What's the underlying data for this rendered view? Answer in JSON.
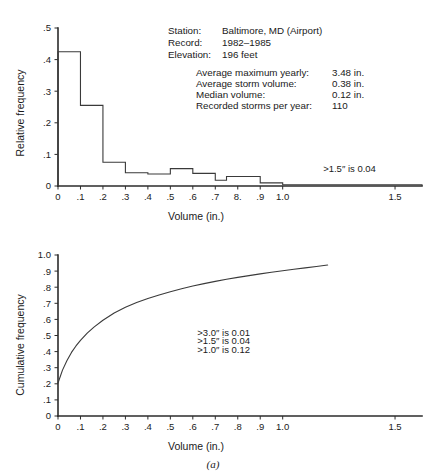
{
  "figure": {
    "caption": "(a)"
  },
  "station_info": {
    "station_label": "Station:",
    "station_value": "Baltimore, MD (Airport)",
    "record_label": "Record:",
    "record_value": "1982–1985",
    "elevation_label": "Elevation:",
    "elevation_value": "196 feet"
  },
  "stats": [
    {
      "label": "Average maximum yearly:",
      "value": "3.48 in."
    },
    {
      "label": "Average storm volume:",
      "value": "0.38 in."
    },
    {
      "label": "Median volume:",
      "value": "0.12 in."
    },
    {
      "label": "Recorded storms per year:",
      "value": "110"
    }
  ],
  "chart_data": [
    {
      "type": "bar",
      "id": "relative-frequency-histogram",
      "title": "",
      "xlabel": "Volume (in.)",
      "ylabel": "Relative frequency",
      "xlim": [
        0,
        1.62
      ],
      "ylim": [
        0,
        0.5
      ],
      "grid": false,
      "legend": null,
      "xticks": [
        0,
        0.1,
        0.2,
        0.3,
        0.4,
        0.5,
        0.6,
        0.7,
        0.8,
        0.9,
        1.0,
        1.5
      ],
      "xticklabels": [
        "0",
        ".1",
        ".2",
        ".3",
        ".4",
        ".5",
        ".6",
        ".7",
        "8.",
        ".9",
        "1.0",
        "1.5"
      ],
      "yticks": [
        0,
        0.1,
        0.2,
        0.3,
        0.4,
        0.5
      ],
      "yticklabels": [
        "0",
        ".1",
        ".2",
        ".3",
        ".4",
        ".5"
      ],
      "bin_edges": [
        0.0,
        0.05,
        0.1,
        0.15,
        0.2,
        0.25,
        0.3,
        0.35,
        0.4,
        0.45,
        0.5,
        0.55,
        0.6,
        0.65,
        0.7,
        0.75,
        0.8,
        0.85,
        0.9,
        0.95,
        1.0,
        1.62
      ],
      "values": [
        0.425,
        0.425,
        0.255,
        0.255,
        0.075,
        0.075,
        0.042,
        0.042,
        0.038,
        0.038,
        0.055,
        0.055,
        0.04,
        0.04,
        0.018,
        0.03,
        0.03,
        0.03,
        0.01,
        0.01,
        0.004
      ],
      "annotations": [
        {
          "text": ">1.5″ is 0.04",
          "x": 1.18,
          "y": 0.045
        }
      ]
    },
    {
      "type": "line",
      "id": "cumulative-frequency-ogive",
      "title": "",
      "xlabel": "Volume (in.)",
      "ylabel": "Cumulative frequency",
      "xlim": [
        0,
        1.62
      ],
      "ylim": [
        0,
        1.0
      ],
      "grid": false,
      "legend": null,
      "xticks": [
        0,
        0.1,
        0.2,
        0.3,
        0.4,
        0.5,
        0.6,
        0.7,
        0.8,
        0.9,
        1.0,
        1.5
      ],
      "xticklabels": [
        "0",
        ".1",
        ".2",
        ".3",
        ".4",
        ".5",
        ".6",
        ".7",
        ".8",
        ".9",
        "1.0",
        "1.5"
      ],
      "yticks": [
        0,
        0.1,
        0.2,
        0.3,
        0.4,
        0.5,
        0.6,
        0.7,
        0.8,
        0.9,
        1.0
      ],
      "yticklabels": [
        "0",
        ".1",
        ".2",
        ".3",
        ".4",
        ".5",
        ".6",
        ".7",
        ".8",
        ".9",
        "1.0"
      ],
      "x": [
        0.0,
        0.005,
        0.02,
        0.04,
        0.06,
        0.08,
        0.1,
        0.13,
        0.16,
        0.2,
        0.25,
        0.3,
        0.35,
        0.4,
        0.45,
        0.5,
        0.55,
        0.6,
        0.65,
        0.7,
        0.75,
        0.8,
        0.85,
        0.9,
        0.95,
        1.0,
        1.05,
        1.1,
        1.15,
        1.2
      ],
      "y": [
        0.205,
        0.225,
        0.285,
        0.345,
        0.395,
        0.435,
        0.47,
        0.515,
        0.552,
        0.595,
        0.64,
        0.675,
        0.705,
        0.73,
        0.752,
        0.772,
        0.79,
        0.807,
        0.822,
        0.836,
        0.849,
        0.861,
        0.872,
        0.883,
        0.893,
        0.902,
        0.911,
        0.92,
        0.929,
        0.938
      ],
      "annotations": [
        {
          "text": ">3.0″ is 0.01",
          "x": 0.62,
          "y": 0.5
        },
        {
          "text": ">1.5″ is 0.04",
          "x": 0.62,
          "y": 0.445
        },
        {
          "text": ">1.0″ is 0.12",
          "x": 0.62,
          "y": 0.39
        }
      ]
    }
  ]
}
